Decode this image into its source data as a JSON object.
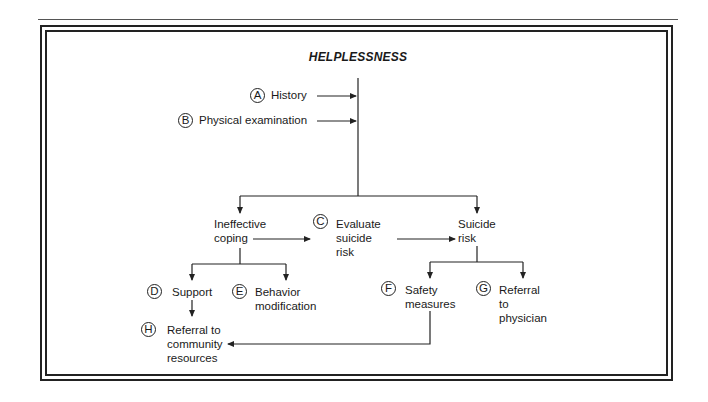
{
  "title": "HELPLESSNESS",
  "nodes": {
    "A": {
      "letter": "A",
      "label": "History"
    },
    "B": {
      "letter": "B",
      "label": "Physical examination"
    },
    "ineffective": {
      "label": "Ineffective\ncoping"
    },
    "C": {
      "letter": "C",
      "label": "Evaluate\nsuicide\nrisk"
    },
    "suicide": {
      "label": "Suicide\nrisk"
    },
    "D": {
      "letter": "D",
      "label": "Support"
    },
    "E": {
      "letter": "E",
      "label": "Behavior\nmodification"
    },
    "F": {
      "letter": "F",
      "label": "Safety\nmeasures"
    },
    "G": {
      "letter": "G",
      "label": "Referral\nto\nphysician"
    },
    "H": {
      "letter": "H",
      "label": "Referral to\ncommunity\nresources"
    }
  },
  "colors": {
    "ink": "#222222",
    "background": "#ffffff"
  }
}
